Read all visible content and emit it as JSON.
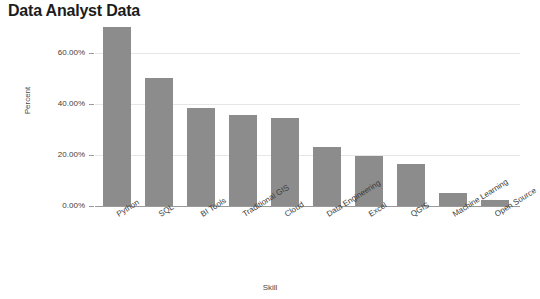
{
  "chart_data": {
    "type": "bar",
    "title": "Data Analyst Data",
    "xlabel": "Skill",
    "ylabel": "Percent",
    "categories": [
      "Python",
      "SQL",
      "BI Tools",
      "Traditional GIS",
      "Cloud",
      "Data Engineering",
      "Excel",
      "QGIS",
      "Machine Learning",
      "Open Source"
    ],
    "values": [
      70.0,
      50.0,
      38.5,
      35.5,
      34.5,
      23.0,
      19.5,
      16.5,
      5.0,
      2.3
    ],
    "value_labels": [
      "70.00%",
      "50.00%",
      "38.50%",
      "35.50%",
      "34.50%",
      "23.00%",
      "19.50%",
      "16.50%",
      "5.00%",
      "2.30%"
    ],
    "ylim": [
      0,
      72
    ],
    "yticks": [
      0,
      20,
      40,
      60
    ],
    "ytick_labels": [
      "0.00%",
      "20.00%",
      "40.00%",
      "60.00%"
    ],
    "grid": true,
    "legend": "none",
    "bar_color": "#8c8c8c",
    "gridline_color": "#e6e6e6",
    "axis_color": "#9a9a9a",
    "background": "#ffffff"
  }
}
